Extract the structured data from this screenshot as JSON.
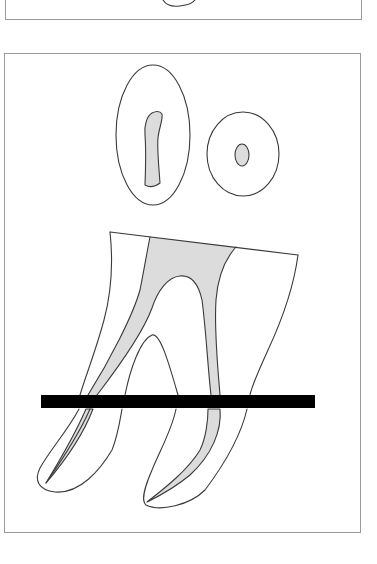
{
  "figure": {
    "top_panel": {
      "visible_fragment": "partial-outline-curve"
    },
    "main_panel": {
      "cross_sections": [
        {
          "id": "oval-section",
          "shape": "ellipse",
          "canal": "elongated-s-shaped"
        },
        {
          "id": "round-section",
          "shape": "circle",
          "canal": "round"
        }
      ],
      "tooth": {
        "roots": 2,
        "pulp_fill": "stippled-gray"
      },
      "section_line": {
        "orientation": "horizontal",
        "color": "#000000"
      }
    },
    "colors": {
      "outline": "#3a3a3a",
      "pulp": "#dcdcdc",
      "frame": "#9a9a9a",
      "bar": "#000000"
    }
  }
}
